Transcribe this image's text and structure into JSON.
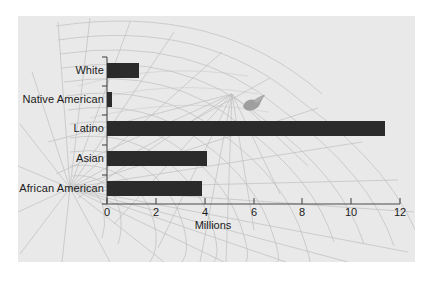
{
  "figure": {
    "panel_background": "#e9e9e9",
    "page_background": "#ffffff",
    "bar_color": "#2b2b2b",
    "text_color": "#1a1a1a",
    "grid_art_color": "#b8b8b8",
    "blob_color": "#9a9a9a",
    "blob_name": "decorative-bird-graphic"
  },
  "chart_data": {
    "type": "bar",
    "orientation": "horizontal",
    "title": "",
    "subtitle": "",
    "xlabel": "Millions",
    "ylabel": "",
    "categories": [
      "White",
      "Native American",
      "Latino",
      "Asian",
      "African American"
    ],
    "values": [
      1.3,
      0.2,
      11.4,
      4.1,
      3.9
    ],
    "series": [
      {
        "name": "Population",
        "values": [
          1.3,
          0.2,
          11.4,
          4.1,
          3.9
        ]
      }
    ],
    "xlim": [
      0,
      12
    ],
    "xticks": [
      0,
      2,
      4,
      6,
      8,
      10,
      12
    ],
    "xtick_labels": [
      "0",
      "2",
      "4",
      "6",
      "8",
      "10",
      "12"
    ],
    "grid": false,
    "legend": false,
    "legend_position": "none"
  },
  "axis": {
    "title": "Millions",
    "tick_labels": [
      "0",
      "2",
      "4",
      "6",
      "8",
      "10",
      "12"
    ]
  },
  "bars": [
    {
      "label": "White",
      "value": 1.3
    },
    {
      "label": "Native American",
      "value": 0.2
    },
    {
      "label": "Latino",
      "value": 11.4
    },
    {
      "label": "Asian",
      "value": 4.1
    },
    {
      "label": "African American",
      "value": 3.9
    }
  ]
}
